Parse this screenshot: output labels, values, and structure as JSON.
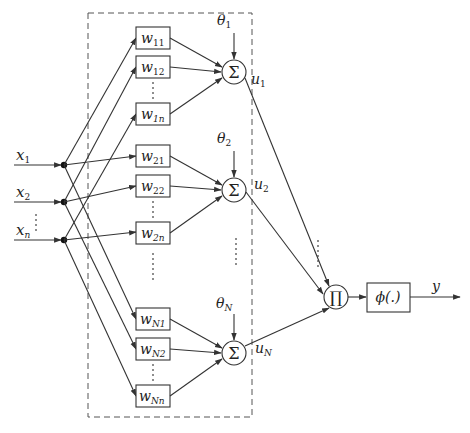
{
  "diagram": {
    "title": "",
    "inputs": [
      {
        "label": "x",
        "sub": "1"
      },
      {
        "label": "x",
        "sub": "2"
      },
      {
        "label": "x",
        "sub": "n"
      }
    ],
    "neurons": [
      {
        "weights": [
          {
            "label": "w",
            "sub": "11"
          },
          {
            "label": "w",
            "sub": "12"
          },
          {
            "label": "w",
            "sub": "1n"
          }
        ],
        "bias": {
          "label": "θ",
          "sub": "1"
        },
        "sum_symbol": "Σ",
        "output": {
          "label": "u",
          "sub": "1"
        }
      },
      {
        "weights": [
          {
            "label": "w",
            "sub": "21"
          },
          {
            "label": "w",
            "sub": "22"
          },
          {
            "label": "w",
            "sub": "2n"
          }
        ],
        "bias": {
          "label": "θ",
          "sub": "2"
        },
        "sum_symbol": "Σ",
        "output": {
          "label": "u",
          "sub": "2"
        }
      },
      {
        "weights": [
          {
            "label": "w",
            "sub": "N1"
          },
          {
            "label": "w",
            "sub": "N2"
          },
          {
            "label": "w",
            "sub": "Nn"
          }
        ],
        "bias": {
          "label": "θ",
          "sub": "N"
        },
        "sum_symbol": "Σ",
        "output": {
          "label": "u",
          "sub": "N"
        }
      }
    ],
    "product_symbol": "∏",
    "activation": {
      "label": "ϕ(.)"
    },
    "output": {
      "label": "y"
    }
  }
}
